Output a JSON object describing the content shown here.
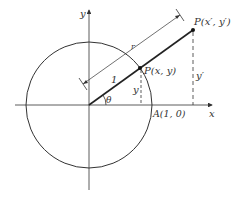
{
  "diagram": {
    "title": "",
    "axes": {
      "x_label": "x",
      "y_label": "y"
    },
    "labels": {
      "point_p": "P(x, y)",
      "point_p_prime": "P(x′, y′)",
      "point_a": "A(1, 0)",
      "angle": "θ",
      "unit_length": "1",
      "radius_length": "r",
      "y_length": "y",
      "y_prime_length": "y′"
    },
    "colors": {
      "stroke": "#333333",
      "background": "#ffffff"
    }
  }
}
